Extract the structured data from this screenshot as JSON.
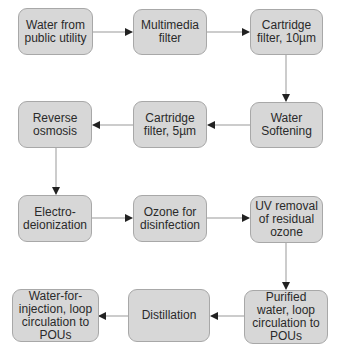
{
  "diagram": {
    "colors": {
      "box_fill": "#d7d7d7",
      "box_border": "#a8a8a8",
      "arrow": "#222222",
      "line": "#999999"
    },
    "nodes": [
      {
        "id": "n1",
        "label": "Water from public utility"
      },
      {
        "id": "n2",
        "label": "Multimedia filter"
      },
      {
        "id": "n3",
        "label": "Cartridge filter, 10µm"
      },
      {
        "id": "n4",
        "label": "Water Softening"
      },
      {
        "id": "n5",
        "label": "Cartridge filter, 5µm"
      },
      {
        "id": "n6",
        "label": "Reverse osmosis"
      },
      {
        "id": "n7",
        "label": "Electro-deionization"
      },
      {
        "id": "n8",
        "label": "Ozone for disinfection"
      },
      {
        "id": "n9",
        "label": "UV removal of residual ozone"
      },
      {
        "id": "n10",
        "label": "Purified water, loop circulation to POUs"
      },
      {
        "id": "n11",
        "label": "Distillation"
      },
      {
        "id": "n12",
        "label": "Water-for-injection, loop circulation to POUs"
      }
    ],
    "edges": [
      [
        "n1",
        "n2"
      ],
      [
        "n2",
        "n3"
      ],
      [
        "n3",
        "n4"
      ],
      [
        "n4",
        "n5"
      ],
      [
        "n5",
        "n6"
      ],
      [
        "n6",
        "n7"
      ],
      [
        "n7",
        "n8"
      ],
      [
        "n8",
        "n9"
      ],
      [
        "n9",
        "n10"
      ],
      [
        "n10",
        "n11"
      ],
      [
        "n11",
        "n12"
      ]
    ]
  }
}
